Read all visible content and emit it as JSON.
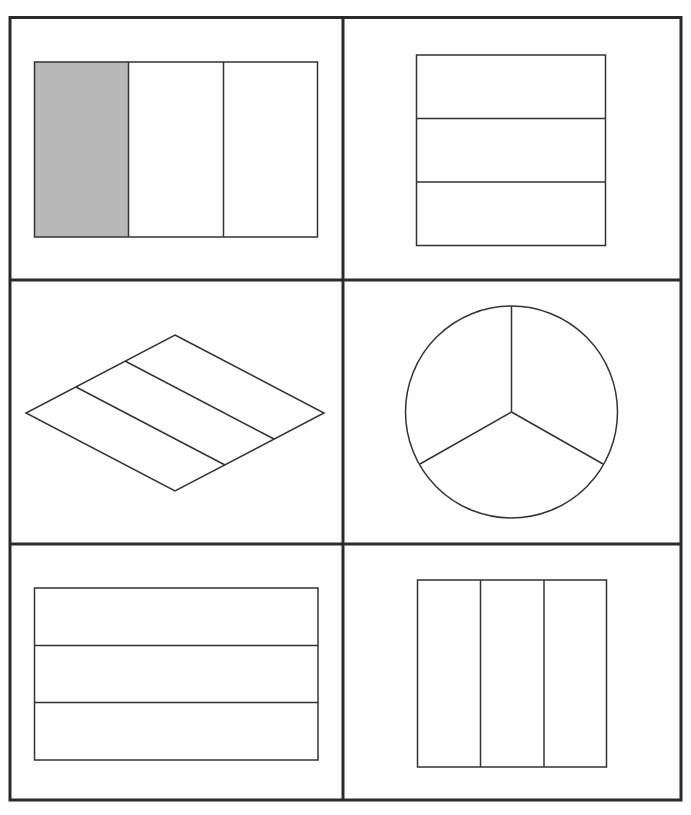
{
  "figure": {
    "colors": {
      "stroke": "#333333",
      "grid_stroke": "#2a2a2a",
      "shaded_fill": "#b8b8b8",
      "background": "#ffffff"
    },
    "grid": {
      "rows": 3,
      "cols": 2
    },
    "cells": [
      {
        "id": "r1c1",
        "shape": "rectangle",
        "division": "3 vertical strips",
        "parts": 3,
        "shaded_parts": 1,
        "shaded_index": 0
      },
      {
        "id": "r1c2",
        "shape": "rectangle",
        "division": "3 horizontal strips",
        "parts": 3,
        "shaded_parts": 0
      },
      {
        "id": "r2c1",
        "shape": "rhombus",
        "division": "3 diagonal strips",
        "parts": 3,
        "shaded_parts": 0
      },
      {
        "id": "r2c2",
        "shape": "circle",
        "division": "3 equal sectors",
        "parts": 3,
        "shaded_parts": 0
      },
      {
        "id": "r3c1",
        "shape": "rectangle",
        "division": "3 horizontal strips",
        "parts": 3,
        "shaded_parts": 0
      },
      {
        "id": "r3c2",
        "shape": "rectangle",
        "division": "3 vertical strips",
        "parts": 3,
        "shaded_parts": 0
      }
    ]
  }
}
